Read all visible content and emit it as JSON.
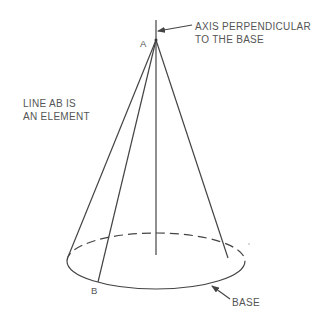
{
  "diagram": {
    "points": {
      "apex_label": "A",
      "base_point_label": "B"
    },
    "annotations": {
      "axis_line1": "AXIS PERPENDICULAR",
      "axis_line2": "TO THE BASE",
      "element_line1": "LINE AB IS",
      "element_line2": "AN ELEMENT",
      "base": "BASE"
    }
  }
}
